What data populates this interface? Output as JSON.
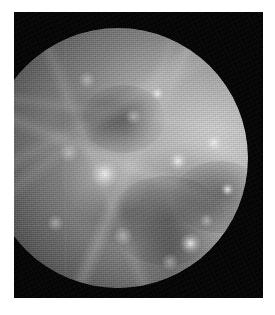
{
  "page": {
    "background_color": "#ffffff",
    "width": 275,
    "height": 315
  },
  "photo": {
    "caption": "",
    "frame_color": "#000000",
    "frame_rect": {
      "x": 14,
      "y": 12,
      "width": 249,
      "height": 286
    },
    "subject": "planet-disk",
    "subject_name": "Mercury",
    "image_type": "grayscale-spacecraft-photograph",
    "illumination": {
      "sun_direction": "right",
      "terminator_side": "left",
      "phase": "gibbous"
    },
    "palette": {
      "space_black": "#000000",
      "limb_highlight": "#d7d7d7",
      "mid_tone": "#9a9a9a",
      "shadow_tone": "#2a2a2a",
      "terminator": "#050505"
    },
    "disk": {
      "center_x": 104,
      "center_y": 146,
      "radius": 130
    },
    "features": [
      {
        "name": "main-ray-crater",
        "x": 45,
        "y": 56,
        "size": 13,
        "tone": "bright"
      },
      {
        "name": "bright-crater-east",
        "x": 78,
        "y": 83,
        "size": 10,
        "tone": "bright"
      },
      {
        "name": "bright-crater-northeast",
        "x": 73,
        "y": 51,
        "size": 9,
        "tone": "bright"
      },
      {
        "name": "bright-crater-limb",
        "x": 87,
        "y": 44,
        "size": 8,
        "tone": "bright"
      },
      {
        "name": "bright-crater-upper",
        "x": 65,
        "y": 25,
        "size": 7,
        "tone": "bright"
      },
      {
        "name": "bright-crater-rim",
        "x": 92,
        "y": 62,
        "size": 7,
        "tone": "bright"
      },
      {
        "name": "crater-central-north",
        "x": 56,
        "y": 34,
        "size": 6,
        "tone": "dim"
      },
      {
        "name": "crater-west-mid",
        "x": 31,
        "y": 48,
        "size": 7,
        "tone": "dim"
      },
      {
        "name": "crater-south-west",
        "x": 26,
        "y": 75,
        "size": 6,
        "tone": "dim"
      },
      {
        "name": "crater-south-central",
        "x": 52,
        "y": 80,
        "size": 7,
        "tone": "dim"
      },
      {
        "name": "crater-south-east",
        "x": 70,
        "y": 90,
        "size": 6,
        "tone": "dim"
      },
      {
        "name": "crater-north-west",
        "x": 38,
        "y": 20,
        "size": 6,
        "tone": "dim"
      },
      {
        "name": "crater-east-lower",
        "x": 84,
        "y": 74,
        "size": 5,
        "tone": "dim"
      },
      {
        "name": "basin-dark-south",
        "x": 58,
        "y": 68,
        "size": 22,
        "tone": "dark"
      },
      {
        "name": "basin-dark-east",
        "x": 80,
        "y": 60,
        "size": 18,
        "tone": "dark"
      },
      {
        "name": "basin-dark-north",
        "x": 44,
        "y": 30,
        "size": 16,
        "tone": "dark"
      }
    ]
  }
}
